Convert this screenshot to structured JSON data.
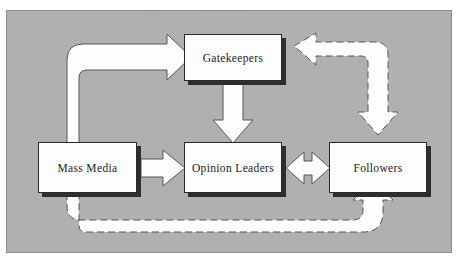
{
  "diagram": {
    "panel_color": "#b0b0b0",
    "node_fill": "#fdfdfd",
    "node_border": "#2a2a2a",
    "shadow_color": "#2e2e2e",
    "arrow_fill": "#fdfdfd",
    "arrow_outline": "#4a4a4a"
  },
  "nodes": [
    {
      "id": "gatekeepers",
      "label": "Gatekeepers"
    },
    {
      "id": "mass_media",
      "label": "Mass Media"
    },
    {
      "id": "opinion_leaders",
      "label": "Opinion Leaders"
    },
    {
      "id": "followers",
      "label": "Followers"
    }
  ],
  "edges": [
    {
      "id": "massmedia-to-gatekeepers",
      "from": "Mass Media",
      "to": "Gatekeepers",
      "style": "solid",
      "heads": "single",
      "shape": "elbow-up-right"
    },
    {
      "id": "gatekeepers-to-opinion",
      "from": "Gatekeepers",
      "to": "Opinion Leaders",
      "style": "solid",
      "heads": "single",
      "shape": "straight-down"
    },
    {
      "id": "massmedia-to-opinion",
      "from": "Mass Media",
      "to": "Opinion Leaders",
      "style": "solid",
      "heads": "single",
      "shape": "straight-right"
    },
    {
      "id": "opinion-to-followers",
      "from": "Opinion Leaders",
      "to": "Followers",
      "style": "solid",
      "heads": "double",
      "shape": "straight-horizontal"
    },
    {
      "id": "followers-to-gatekeepers",
      "from": "Followers",
      "to": "Gatekeepers",
      "style": "dashed",
      "heads": "double",
      "shape": "elbow-up-left"
    },
    {
      "id": "massmedia-to-followers-feedback",
      "from": "Mass Media",
      "to": "Followers",
      "style": "dashed",
      "heads": "single",
      "shape": "elbow-down-right-up"
    }
  ]
}
